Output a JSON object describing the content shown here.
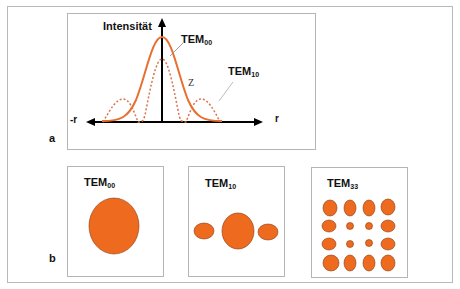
{
  "figure": {
    "panel_a": {
      "label": "a",
      "y_axis_label": "Intensität",
      "x_axis_neg_label": "-r",
      "x_axis_pos_label": "r",
      "annotation_z": "Z",
      "curves": [
        {
          "name": "TEM",
          "subscript": "00",
          "style": "solid",
          "color": "#e8702f"
        },
        {
          "name": "TEM",
          "subscript": "10",
          "style": "dotted",
          "color": "#d9744a"
        }
      ]
    },
    "panel_b": {
      "label": "b",
      "modes": [
        {
          "name": "TEM",
          "subscript": "00"
        },
        {
          "name": "TEM",
          "subscript": "10"
        },
        {
          "name": "TEM",
          "subscript": "33"
        }
      ],
      "spot_color": "#ee6a1e"
    }
  }
}
